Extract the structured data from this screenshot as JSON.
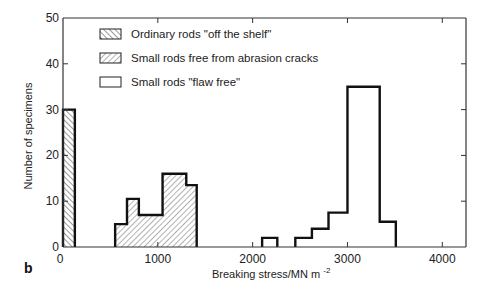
{
  "chart_data": {
    "type": "bar",
    "subtype": "histogram",
    "panel_label": "b",
    "title": "",
    "xlabel": "Breaking stress/MN m",
    "xlabel_superscript": "-2",
    "ylabel": "Number of specimens",
    "xlim": [
      0,
      4250
    ],
    "ylim": [
      0,
      50
    ],
    "xticks": [
      0,
      1000,
      2000,
      3000,
      4000
    ],
    "xtick_labels": [
      "0",
      "1000",
      "2000",
      "3000",
      "4000"
    ],
    "yticks": [
      0,
      10,
      20,
      30,
      40,
      50
    ],
    "ytick_labels": [
      "0",
      "10",
      "20",
      "30",
      "40",
      "50"
    ],
    "grid": false,
    "legend_position": "top-left",
    "series": [
      {
        "name": "Ordinary rods \"off the shelf\"",
        "pattern": "hatch-back",
        "bins": [
          {
            "x0": 0,
            "x1": 125,
            "count": 30
          }
        ]
      },
      {
        "name": "Small rods free from abrasion cracks",
        "pattern": "hatch-forward",
        "bins": [
          {
            "x0": 550,
            "x1": 675,
            "count": 5
          },
          {
            "x0": 675,
            "x1": 800,
            "count": 10.5
          },
          {
            "x0": 800,
            "x1": 1050,
            "count": 7
          },
          {
            "x0": 1050,
            "x1": 1300,
            "count": 16
          },
          {
            "x0": 1300,
            "x1": 1410,
            "count": 13.5
          }
        ]
      },
      {
        "name": "Small rods \"flaw free\"",
        "pattern": "none",
        "bins": [
          {
            "x0": 2100,
            "x1": 2260,
            "count": 2
          },
          {
            "x0": 2450,
            "x1": 2625,
            "count": 2
          },
          {
            "x0": 2625,
            "x1": 2800,
            "count": 4
          },
          {
            "x0": 2800,
            "x1": 3000,
            "count": 7.5
          },
          {
            "x0": 3000,
            "x1": 3340,
            "count": 35
          },
          {
            "x0": 3340,
            "x1": 3510,
            "count": 5.5
          }
        ]
      }
    ]
  }
}
